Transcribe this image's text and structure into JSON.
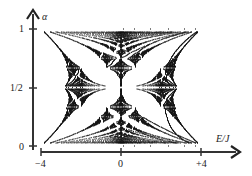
{
  "chart_data": {
    "type": "heatmap",
    "title": "",
    "xlabel": "E/J",
    "ylabel": "α",
    "xlim": [
      -4,
      4
    ],
    "ylim": [
      0,
      1
    ],
    "x_ticks": [
      {
        "value": -4,
        "label": "−4"
      },
      {
        "value": 0,
        "label": "0"
      },
      {
        "value": 4,
        "label": "+4"
      }
    ],
    "y_ticks": [
      {
        "value": 0,
        "label": "0"
      },
      {
        "value": 0.5,
        "label": "1/2"
      },
      {
        "value": 1,
        "label": "1"
      }
    ],
    "grid": false,
    "legend": null,
    "band_edges_sample": [
      {
        "alpha": 0,
        "E_min": -4,
        "E_max": 4
      },
      {
        "alpha": 0.5,
        "E_min": -2.83,
        "E_max": 2.83
      },
      {
        "alpha": 1,
        "E_min": -4,
        "E_max": 4
      }
    ],
    "colors": {
      "ink": "#111111",
      "axis": "#333333",
      "background": "#ffffff"
    }
  }
}
